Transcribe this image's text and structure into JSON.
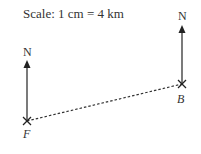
{
  "scale_label": "Scale: 1 cm = 4 km",
  "points": [
    {
      "name": "F",
      "north_label": "N"
    },
    {
      "name": "B",
      "north_label": "N"
    }
  ],
  "colors": {
    "ink": "#333333"
  }
}
